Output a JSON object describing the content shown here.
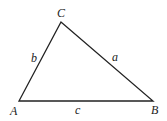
{
  "diagram": {
    "type": "triangle",
    "stroke_color": "#222222",
    "background": "#ffffff",
    "vertices": {
      "A": {
        "label": "A",
        "x": 19,
        "y": 101
      },
      "B": {
        "label": "B",
        "x": 153,
        "y": 101
      },
      "C": {
        "label": "C",
        "x": 61,
        "y": 22
      }
    },
    "sides": {
      "a": {
        "label": "a",
        "from": "C",
        "to": "B"
      },
      "b": {
        "label": "b",
        "from": "A",
        "to": "C"
      },
      "c": {
        "label": "c",
        "from": "A",
        "to": "B"
      }
    }
  }
}
